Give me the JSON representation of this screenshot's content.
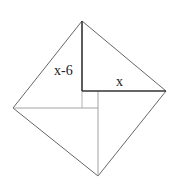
{
  "diagram": {
    "type": "geometry",
    "labels": {
      "vertical_leg": "x-6",
      "horizontal_leg": "x"
    },
    "vertices": {
      "top": [
        82,
        21
      ],
      "right": [
        166,
        91
      ],
      "bottom": [
        98,
        176
      ],
      "left": [
        13,
        108
      ]
    },
    "inner_square": {
      "top_left": [
        82,
        91
      ],
      "bottom_right": [
        98,
        108
      ]
    },
    "colors": {
      "outline": "#444444",
      "highlight": "#333333",
      "inner": "#999999"
    }
  }
}
